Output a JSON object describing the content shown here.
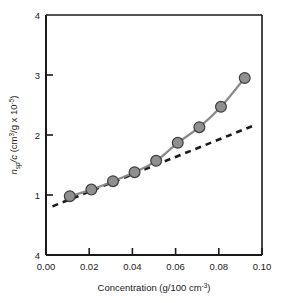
{
  "chart_data": {
    "type": "line",
    "title": "",
    "subtitle": "",
    "xlabel": "Concentration (g/100 cm-3)",
    "xlabel_parts": {
      "main": "Concentration (g/100 cm",
      "exponent": "-3",
      "tail": ")"
    },
    "ylabel": "nsp/c (cm3/g x 10-5)",
    "ylabel_parts": {
      "n": "n",
      "n_sub": "sp",
      "slash_c": "/c",
      "open": " (cm",
      "cube": "3",
      "per_g": "/g x 10",
      "exp": "-5",
      "close": ")"
    },
    "xlim": [
      0.0,
      0.1
    ],
    "ylim": [
      0,
      4
    ],
    "xticks": [
      0.0,
      0.02,
      0.04,
      0.06,
      0.08,
      0.1
    ],
    "xticklabels": [
      "0.00",
      "0.02",
      "0.04",
      "0.06",
      "0.08",
      "0.10"
    ],
    "yticks": [
      4,
      3,
      2,
      1,
      0
    ],
    "yticklabels": [
      "4",
      "3",
      "2",
      "1",
      "4"
    ],
    "grid": false,
    "legend": null,
    "series": [
      {
        "name": "measured",
        "style": "solid-with-markers",
        "color": "#8a8a8a",
        "marker_fill": "#8f8f8f",
        "marker_edge": "#3d3d3d",
        "x": [
          0.011,
          0.021,
          0.031,
          0.041,
          0.051,
          0.061,
          0.071,
          0.081,
          0.092
        ],
        "y": [
          0.98,
          1.09,
          1.23,
          1.38,
          1.57,
          1.87,
          2.13,
          2.47,
          2.95
        ]
      },
      {
        "name": "linear-extrapolation",
        "style": "dashed",
        "color": "#1a1a1a",
        "x": [
          0.003,
          0.097
        ],
        "y": [
          0.81,
          2.17
        ]
      }
    ]
  },
  "figure": {
    "background": "#ffffff",
    "axis_color": "#1a1a1a",
    "plot_area": {
      "left": 46,
      "top": 15,
      "right": 262,
      "bottom": 255
    }
  }
}
